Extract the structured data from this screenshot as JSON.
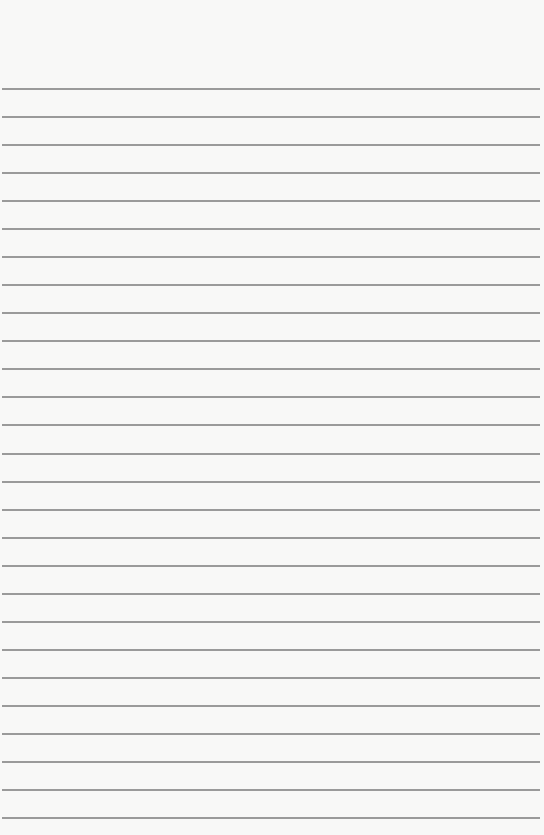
{
  "document": {
    "type": "lined-paper",
    "background_color": "#f8f8f7",
    "line_color": "#8a8a8a",
    "line_count": 27,
    "first_line_y": 88,
    "line_spacing": 28.04,
    "text": ""
  }
}
